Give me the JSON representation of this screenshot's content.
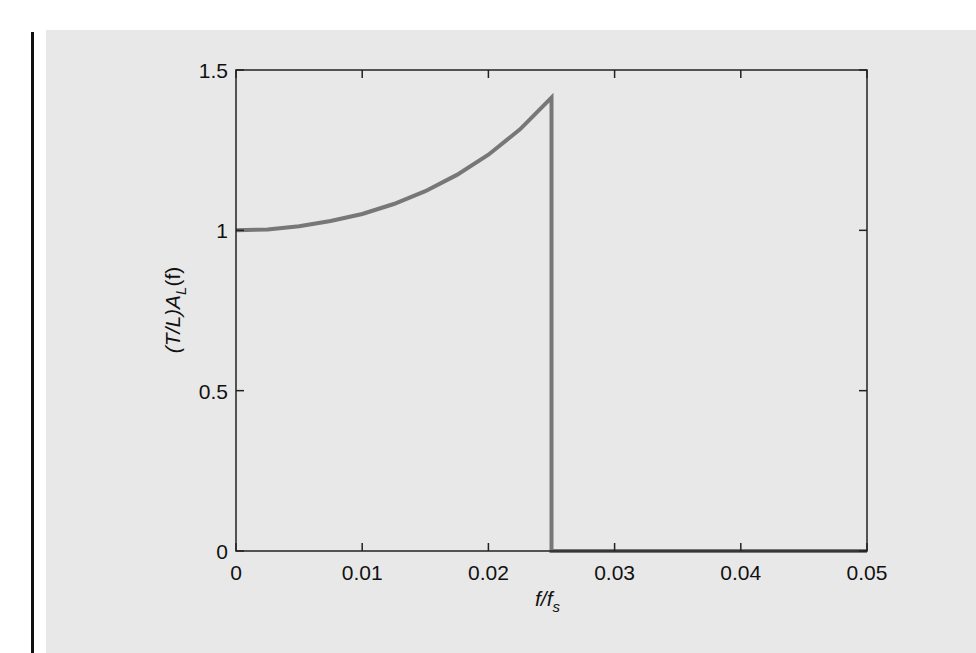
{
  "chart_data": {
    "type": "line",
    "title": "",
    "xlabel": "f/f_s",
    "ylabel": "(T/L)A_L(f)",
    "xlim": [
      0,
      0.05
    ],
    "ylim": [
      0,
      1.5
    ],
    "x_ticks": [
      "0",
      "0.01",
      "0.02",
      "0.03",
      "0.04",
      "0.05"
    ],
    "y_ticks": [
      "0",
      "0.5",
      "1",
      "1.5"
    ],
    "grid": false,
    "legend": null,
    "series": [
      {
        "name": "(T/L)A_L(f)",
        "color": "#777777",
        "x": [
          0,
          0.0025,
          0.005,
          0.0075,
          0.01,
          0.0125,
          0.015,
          0.0175,
          0.02,
          0.0225,
          0.025,
          0.025,
          0.03,
          0.035,
          0.04,
          0.045,
          0.05
        ],
        "y": [
          1.0,
          1.003,
          1.013,
          1.029,
          1.051,
          1.082,
          1.122,
          1.173,
          1.236,
          1.315,
          1.414,
          0,
          0,
          0,
          0,
          0,
          0
        ]
      }
    ]
  },
  "labels": {
    "xlabel_main": "f/f",
    "xlabel_sub": "s",
    "ylabel_pre": "(T/L)A",
    "ylabel_sub": "L",
    "ylabel_post": "(f)"
  }
}
